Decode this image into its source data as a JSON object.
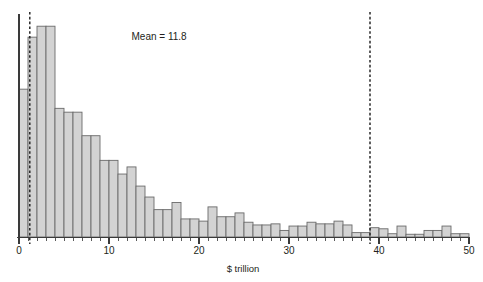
{
  "chart_data": {
    "type": "bar",
    "title": "",
    "subtitle": "",
    "xlabel": "$ trillion",
    "ylabel": "",
    "xlim": [
      0,
      50
    ],
    "ylim": [
      0,
      40
    ],
    "grid": false,
    "legend": null,
    "bin_width": 1,
    "bar_fill": "#d3d3d3",
    "bar_stroke": "#6a6a6a",
    "xticks": [
      {
        "value": 0,
        "label": "0"
      },
      {
        "value": 10,
        "label": "10"
      },
      {
        "value": 20,
        "label": "20"
      },
      {
        "value": 30,
        "label": "30"
      },
      {
        "value": 40,
        "label": "40"
      },
      {
        "value": 50,
        "label": "50"
      }
    ],
    "minor_tick_step": 1,
    "categories": [
      "0-1",
      "1-2",
      "2-3",
      "3-4",
      "4-5",
      "5-6",
      "6-7",
      "7-8",
      "8-9",
      "9-10",
      "10-11",
      "11-12",
      "12-13",
      "13-14",
      "14-15",
      "15-16",
      "16-17",
      "17-18",
      "18-19",
      "19-20",
      "20-21",
      "21-22",
      "22-23",
      "23-24",
      "24-25",
      "25-26",
      "26-27",
      "27-28",
      "28-29",
      "29-30",
      "30-31",
      "31-32",
      "32-33",
      "33-34",
      "34-35",
      "35-36",
      "36-37",
      "37-38",
      "38-39",
      "39-40",
      "40-41",
      "41-42",
      "42-43",
      "43-44",
      "44-45",
      "45-46",
      "46-47",
      "47-48",
      "48-49",
      "49-50"
    ],
    "bin_starts": [
      0,
      1,
      2,
      3,
      4,
      5,
      6,
      7,
      8,
      9,
      10,
      11,
      12,
      13,
      14,
      15,
      16,
      17,
      18,
      19,
      20,
      21,
      22,
      23,
      24,
      25,
      26,
      27,
      28,
      29,
      30,
      31,
      32,
      33,
      34,
      35,
      36,
      37,
      38,
      39,
      40,
      41,
      42,
      43,
      44,
      45,
      46,
      47,
      48,
      49
    ],
    "values": [
      27.0,
      36.5,
      38.5,
      38.5,
      23.5,
      22.8,
      22.8,
      18.5,
      18.5,
      14.0,
      14.0,
      11.5,
      12.8,
      9.3,
      7.3,
      5.0,
      5.0,
      6.3,
      3.3,
      3.3,
      2.9,
      5.5,
      3.7,
      3.7,
      4.4,
      2.7,
      2.2,
      2.2,
      2.4,
      1.2,
      2.0,
      2.0,
      2.7,
      2.4,
      2.4,
      2.9,
      2.2,
      0.8,
      0.8,
      1.7,
      1.5,
      0.6,
      2.0,
      0.5,
      0.5,
      1.2,
      1.2,
      2.0,
      0.6,
      0.6
    ],
    "reference_lines": [
      {
        "name": "lower-dashed-line",
        "x": 1.2,
        "style": "dashed"
      },
      {
        "name": "upper-dashed-line",
        "x": 39.0,
        "style": "dashed"
      }
    ],
    "annotations": [
      {
        "name": "mean-annotation",
        "text": "Mean = 11.8",
        "x": 12.5,
        "y": 36.0
      }
    ]
  }
}
